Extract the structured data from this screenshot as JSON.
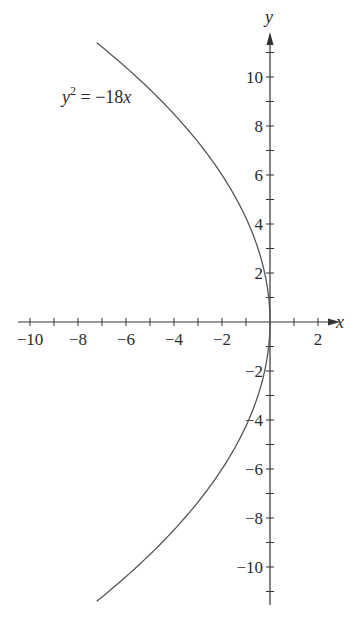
{
  "chart_data": {
    "type": "line",
    "title": "",
    "equation_label": "y² = −18x",
    "equation_parts": {
      "lhs_var": "y",
      "lhs_exp": "2",
      "eq": " = −18",
      "rhs_var": "x"
    },
    "xlabel": "x",
    "ylabel": "y",
    "xlim": [
      -10.5,
      2.5
    ],
    "ylim": [
      -11.5,
      11.5
    ],
    "grid": false,
    "legend": null,
    "x_ticks": [
      -10,
      -9,
      -8,
      -7,
      -6,
      -5,
      -4,
      -3,
      -2,
      -1,
      0,
      1,
      2
    ],
    "x_tick_labels": [
      {
        "value": -10,
        "label": "−10"
      },
      {
        "value": -8,
        "label": "−8"
      },
      {
        "value": -6,
        "label": "−6"
      },
      {
        "value": -4,
        "label": "−4"
      },
      {
        "value": -2,
        "label": "−2"
      },
      {
        "value": 2,
        "label": "2"
      }
    ],
    "y_ticks": [
      -11,
      -10,
      -9,
      -8,
      -7,
      -6,
      -5,
      -4,
      -3,
      -2,
      -1,
      1,
      2,
      3,
      4,
      5,
      6,
      7,
      8,
      9,
      10,
      11
    ],
    "y_tick_labels": [
      {
        "value": 10,
        "label": "10"
      },
      {
        "value": 8,
        "label": "8"
      },
      {
        "value": 6,
        "label": "6"
      },
      {
        "value": 4,
        "label": "4"
      },
      {
        "value": 2,
        "label": "2"
      },
      {
        "value": -2,
        "label": "−2"
      },
      {
        "value": -4,
        "label": "−4"
      },
      {
        "value": -6,
        "label": "−6"
      },
      {
        "value": -8,
        "label": "−8"
      },
      {
        "value": -10,
        "label": "−10"
      }
    ],
    "series": [
      {
        "name": "y^2 = -18x",
        "description": "Parabola opening left with vertex at origin",
        "y_range": [
          -11.4,
          11.4
        ],
        "points": [
          {
            "x": -7.22,
            "y": 11.4
          },
          {
            "x": -5.56,
            "y": 10
          },
          {
            "x": -3.56,
            "y": 8
          },
          {
            "x": -2.0,
            "y": 6
          },
          {
            "x": -0.89,
            "y": 4
          },
          {
            "x": -0.22,
            "y": 2
          },
          {
            "x": 0,
            "y": 0
          },
          {
            "x": -0.22,
            "y": -2
          },
          {
            "x": -0.89,
            "y": -4
          },
          {
            "x": -2.0,
            "y": -6
          },
          {
            "x": -3.56,
            "y": -8
          },
          {
            "x": -5.56,
            "y": -10
          },
          {
            "x": -7.22,
            "y": -11.4
          }
        ]
      }
    ],
    "colors": {
      "curve": "#555555",
      "axis": "#333333",
      "text": "#2a2a2a"
    }
  }
}
